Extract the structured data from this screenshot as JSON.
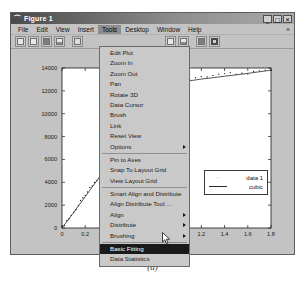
{
  "window": {
    "title": "Figure 1",
    "icon": "matlab-figure-icon",
    "controls": [
      {
        "name": "minimize-button",
        "glyph": "_"
      },
      {
        "name": "maximize-button",
        "glyph": "□"
      },
      {
        "name": "close-button",
        "glyph": "✕"
      }
    ]
  },
  "menubar": {
    "items": [
      {
        "label": "File",
        "active": false
      },
      {
        "label": "Edit",
        "active": false
      },
      {
        "label": "View",
        "active": false
      },
      {
        "label": "Insert",
        "active": false
      },
      {
        "label": "Tools",
        "active": true
      },
      {
        "label": "Desktop",
        "active": false
      },
      {
        "label": "Window",
        "active": false
      },
      {
        "label": "Help",
        "active": false
      }
    ],
    "overflow_glyph": "»"
  },
  "toolbar": {
    "buttons": [
      {
        "name": "new-figure-icon",
        "style": "plain"
      },
      {
        "name": "open-file-icon",
        "style": "plain"
      },
      {
        "name": "save-figure-icon",
        "style": "dark"
      },
      {
        "name": "print-figure-icon",
        "style": "half"
      },
      {
        "name": "edit-plot-pointer-icon",
        "style": "dot"
      },
      {
        "name": "zoom-in-icon",
        "style": "plain"
      },
      {
        "name": "data-cursor-icon",
        "style": "plain"
      },
      {
        "name": "insert-colorbar-icon",
        "style": "half"
      },
      {
        "name": "insert-legend-icon",
        "style": "dark"
      },
      {
        "name": "hide-plot-tools-icon",
        "style": "ring"
      }
    ]
  },
  "tools_menu": {
    "items": [
      {
        "label": "Edit Plot",
        "submenu": false,
        "selected": false,
        "separator_after": false
      },
      {
        "label": "Zoom In",
        "submenu": false,
        "selected": false,
        "separator_after": false
      },
      {
        "label": "Zoom Out",
        "submenu": false,
        "selected": false,
        "separator_after": false
      },
      {
        "label": "Pan",
        "submenu": false,
        "selected": false,
        "separator_after": false
      },
      {
        "label": "Rotate 3D",
        "submenu": false,
        "selected": false,
        "separator_after": false
      },
      {
        "label": "Data Cursor",
        "submenu": false,
        "selected": false,
        "separator_after": false
      },
      {
        "label": "Brush",
        "submenu": false,
        "selected": false,
        "separator_after": false
      },
      {
        "label": "Link",
        "submenu": false,
        "selected": false,
        "separator_after": false
      },
      {
        "label": "Reset View",
        "submenu": false,
        "selected": false,
        "separator_after": false
      },
      {
        "label": "Options",
        "submenu": true,
        "selected": false,
        "separator_after": true
      },
      {
        "label": "Pin to Axes",
        "submenu": false,
        "selected": false,
        "separator_after": false
      },
      {
        "label": "Snap To Layout Grid",
        "submenu": false,
        "selected": false,
        "separator_after": false
      },
      {
        "label": "View Layout Grid",
        "submenu": false,
        "selected": false,
        "separator_after": true
      },
      {
        "label": "Smart Align and Distribute",
        "submenu": false,
        "selected": false,
        "separator_after": false
      },
      {
        "label": "Align Distribute Tool ...",
        "submenu": false,
        "selected": false,
        "separator_after": false
      },
      {
        "label": "Align",
        "submenu": true,
        "selected": false,
        "separator_after": false
      },
      {
        "label": "Distribute",
        "submenu": true,
        "selected": false,
        "separator_after": false
      },
      {
        "label": "Brushing",
        "submenu": true,
        "selected": false,
        "separator_after": true
      },
      {
        "label": "Basic Fitting",
        "submenu": false,
        "selected": true,
        "separator_after": false
      },
      {
        "label": "Data Statistics",
        "submenu": false,
        "selected": false,
        "separator_after": false
      }
    ]
  },
  "caption": "(a)",
  "chart_data": {
    "type": "scatter",
    "title": "",
    "xlabel": "",
    "ylabel": "",
    "xlim": [
      0,
      1.8
    ],
    "ylim": [
      0,
      14000
    ],
    "xticks": [
      0,
      0.2,
      0.4,
      0.6,
      0.8,
      1,
      1.2,
      1.4,
      1.6,
      1.8
    ],
    "xticklabels": [
      "0",
      "0.2",
      "0.4",
      "0.6",
      "0.8",
      "1",
      "1.2",
      "1.4",
      "1.6",
      "1.8"
    ],
    "yticks": [
      0,
      2000,
      4000,
      6000,
      8000,
      10000,
      12000,
      14000
    ],
    "yticklabels": [
      "0",
      "2000",
      "4000",
      "6000",
      "8000",
      "10000",
      "12000",
      "14000"
    ],
    "grid": false,
    "legend": {
      "position": "center-right",
      "entries": [
        {
          "label": "data 1",
          "marker": "point",
          "line": false,
          "color": "#1a1a1a"
        },
        {
          "label": "cubic",
          "marker": "none",
          "line": true,
          "color": "#2a2a2a"
        }
      ]
    },
    "series": [
      {
        "name": "data 1",
        "marker": "point",
        "x": [
          0.0,
          0.02,
          0.04,
          0.06,
          0.08,
          0.1,
          0.12,
          0.14,
          0.16,
          0.18,
          0.2,
          0.22,
          0.24,
          0.26,
          0.28,
          0.3,
          0.32,
          0.34,
          0.36,
          0.38,
          0.4,
          0.42,
          0.44,
          0.46,
          0.48,
          0.5,
          0.52,
          0.54,
          0.56,
          0.58,
          0.6,
          0.62,
          0.64,
          0.66,
          0.68,
          0.7,
          0.72,
          0.74,
          0.76,
          0.78,
          0.8,
          0.82,
          0.84,
          0.86,
          0.88,
          0.9,
          0.92,
          0.94,
          0.96,
          0.98,
          1.0,
          1.05,
          1.1,
          1.15,
          1.2,
          1.25,
          1.3,
          1.35,
          1.4,
          1.45,
          1.5,
          1.55,
          1.6,
          1.65,
          1.7,
          1.75,
          1.8
        ],
        "y": [
          60,
          300,
          560,
          820,
          1080,
          1350,
          1620,
          1900,
          2180,
          2460,
          2740,
          3020,
          3300,
          3580,
          3860,
          4140,
          4420,
          4700,
          4980,
          5260,
          5540,
          5820,
          6090,
          6370,
          6650,
          6920,
          7200,
          7460,
          7740,
          8000,
          8260,
          8520,
          8780,
          9030,
          9280,
          9530,
          9780,
          10020,
          10260,
          10500,
          10730,
          10960,
          11180,
          11400,
          11610,
          11810,
          12000,
          12190,
          12360,
          12520,
          12670,
          12780,
          12880,
          12970,
          13030,
          13090,
          13150,
          13210,
          13280,
          13340,
          13400,
          13460,
          13530,
          13600,
          13670,
          13740,
          13810
        ]
      },
      {
        "name": "cubic",
        "line": true,
        "x": [
          0.0,
          0.1,
          0.2,
          0.3,
          0.4,
          0.5,
          0.6,
          0.7,
          0.8,
          0.9,
          1.0,
          1.1,
          1.2,
          1.3,
          1.4,
          1.5,
          1.6,
          1.7,
          1.8
        ],
        "y": [
          0,
          1350,
          2740,
          4140,
          5540,
          6920,
          8260,
          9530,
          10730,
          11810,
          12670,
          12880,
          13030,
          13150,
          13280,
          13400,
          13530,
          13670,
          13810
        ]
      }
    ]
  }
}
